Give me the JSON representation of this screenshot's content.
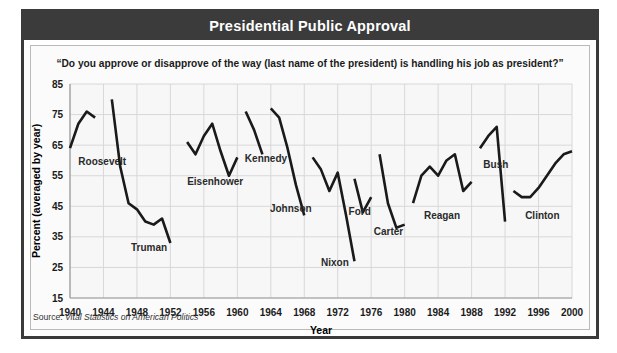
{
  "header": {
    "title": "Presidential Public Approval"
  },
  "subtitle": "“Do you approve or disapprove of the way (last name of the president) is handling his job as president?”",
  "source": {
    "label": "Source: ",
    "title": "Vital Statistics on American Politics"
  },
  "colors": {
    "frame": "#3b3b3b",
    "titlebar_bg": "#3b3b3b",
    "titlebar_text": "#ffffff",
    "plot_bg": "#f7f7f7",
    "gridline": "#d8d8d8",
    "line": "#1a1a1a",
    "label_text": "#2a2a2a"
  },
  "chart_data": {
    "type": "line",
    "title": "Presidential Public Approval",
    "subtitle": "“Do you approve or disapprove of the way (last name of the president) is handling his job as president?”",
    "xlabel": "Year",
    "ylabel": "Percent (averaged by year)",
    "xlim": [
      1940,
      2000
    ],
    "ylim": [
      15,
      85
    ],
    "xticks": [
      1940,
      1944,
      1948,
      1952,
      1956,
      1960,
      1964,
      1968,
      1972,
      1976,
      1980,
      1984,
      1988,
      1992,
      1996,
      2000
    ],
    "yticks": [
      15,
      25,
      35,
      45,
      55,
      65,
      75,
      85
    ],
    "grid": true,
    "legend": "inline-annotations",
    "series": [
      {
        "name": "Roosevelt",
        "label_x": 1941.0,
        "label_y": 58.5,
        "x": [
          1940,
          1941,
          1942,
          1943
        ],
        "values": [
          64,
          72,
          76,
          74
        ]
      },
      {
        "name": "Truman",
        "label_x": 1947.3,
        "label_y": 30.5,
        "x": [
          1945,
          1946,
          1947,
          1948,
          1949,
          1950,
          1951,
          1952
        ],
        "values": [
          80,
          58,
          46,
          44,
          40,
          39,
          41,
          33
        ]
      },
      {
        "name": "Eisenhower",
        "label_x": 1954.0,
        "label_y": 52.0,
        "x": [
          1954,
          1955,
          1956,
          1957,
          1958,
          1959,
          1960
        ],
        "values": [
          66,
          62,
          68,
          72,
          63,
          55,
          61
        ]
      },
      {
        "name": "Kennedy",
        "label_x": 1960.9,
        "label_y": 59.5,
        "x": [
          1961,
          1962,
          1963
        ],
        "values": [
          76,
          70,
          62
        ]
      },
      {
        "name": "Johnson",
        "label_x": 1963.9,
        "label_y": 43.0,
        "x": [
          1964,
          1965,
          1966,
          1967,
          1968
        ],
        "values": [
          77,
          74,
          64,
          52,
          42
        ]
      },
      {
        "name": "Nixon",
        "label_x": 1970.0,
        "label_y": 25.5,
        "x": [
          1969,
          1970,
          1971,
          1972,
          1973,
          1974
        ],
        "values": [
          61,
          57,
          50,
          56,
          42,
          27
        ]
      },
      {
        "name": "Ford",
        "label_x": 1973.3,
        "label_y": 42.0,
        "x": [
          1974,
          1975,
          1976
        ],
        "values": [
          54,
          43,
          48
        ]
      },
      {
        "name": "Carter",
        "label_x": 1976.3,
        "label_y": 35.5,
        "x": [
          1977,
          1978,
          1979,
          1980
        ],
        "values": [
          62,
          46,
          38,
          39
        ]
      },
      {
        "name": "Reagan",
        "label_x": 1982.3,
        "label_y": 41.0,
        "x": [
          1981,
          1982,
          1983,
          1984,
          1985,
          1986,
          1987,
          1988
        ],
        "values": [
          46,
          55,
          58,
          55,
          60,
          62,
          50,
          53
        ]
      },
      {
        "name": "Bush",
        "label_x": 1989.4,
        "label_y": 57.5,
        "x": [
          1989,
          1990,
          1991,
          1992
        ],
        "values": [
          64,
          68,
          71,
          40
        ]
      },
      {
        "name": "Clinton",
        "label_x": 1994.4,
        "label_y": 41.0,
        "x": [
          1993,
          1994,
          1995,
          1996,
          1997,
          1998,
          1999,
          2000
        ],
        "values": [
          50,
          48,
          48,
          51,
          55,
          59,
          62,
          63
        ]
      }
    ]
  }
}
